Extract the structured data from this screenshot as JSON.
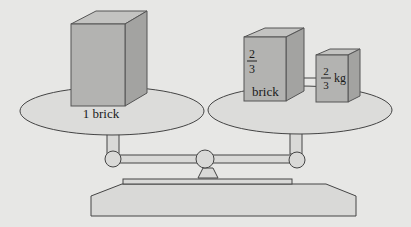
{
  "diagram": {
    "type": "balance-scale",
    "left_pan": {
      "label": "1 brick"
    },
    "right_pan": {
      "brick": {
        "numerator": "2",
        "denominator": "3",
        "unit": "brick"
      },
      "weight": {
        "numerator": "2",
        "denominator": "3",
        "unit": "kg"
      }
    },
    "colors": {
      "background": "#e7e7e5",
      "box_front": "#b3b3b1",
      "box_side": "#a3a3a1",
      "box_top": "#c3c3c1",
      "pan": "#dcdcda",
      "stroke": "#444444"
    }
  }
}
